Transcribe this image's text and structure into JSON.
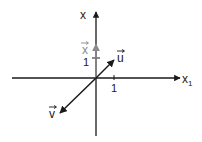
{
  "diagram": {
    "title": "",
    "axes": {
      "horizontal": {
        "label": "x",
        "subscript": "1",
        "tick_label": "1"
      },
      "vertical": {
        "label": "x",
        "subscript": "",
        "tick_label": "1"
      }
    },
    "vectors": [
      {
        "name": "x",
        "label": "x",
        "has_arrow_accent": true,
        "color": "#8a8a8a",
        "direction": "up",
        "length_units": 1.0
      },
      {
        "name": "u",
        "label": "u",
        "has_arrow_accent": true,
        "color": "#1a1a1a",
        "direction": "up-right"
      },
      {
        "name": "v",
        "label": "v",
        "has_arrow_accent": true,
        "color": "#1a1a1a",
        "direction": "down-left"
      }
    ],
    "colors": {
      "axis": "#1a1a1a",
      "vector_x": "#8a8a8a",
      "vector_u": "#1a1a1a",
      "vector_v": "#1a1a1a",
      "text": "#1a1a1a",
      "text_gray": "#8a8a8a"
    }
  }
}
